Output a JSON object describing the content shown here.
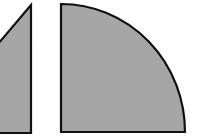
{
  "diagram": {
    "colors": {
      "fill": "#a6a6a6",
      "stroke": "#111111",
      "background": "#ffffff"
    },
    "shapes": [
      {
        "id": "wedge",
        "type": "polygon",
        "points": "-2,44 31,5 31,133 -2,133"
      },
      {
        "id": "quarter-circle",
        "type": "sector",
        "center_x": 61,
        "center_y": 132,
        "radius_x": 124,
        "radius_y": 128
      }
    ]
  }
}
